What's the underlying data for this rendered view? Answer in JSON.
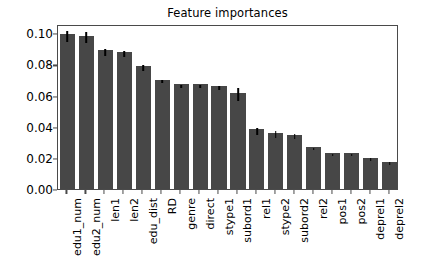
{
  "chart_data": {
    "type": "bar",
    "title": "Feature importances",
    "xlabel": "",
    "ylabel": "",
    "ylim": [
      0.0,
      0.106
    ],
    "yticks": [
      "0.00",
      "0.02",
      "0.04",
      "0.06",
      "0.08",
      "0.10"
    ],
    "ytick_values": [
      0.0,
      0.02,
      0.04,
      0.06,
      0.08,
      0.1
    ],
    "grid": false,
    "legend": null,
    "bar_color": "#474747",
    "errorbar_color": "#000000",
    "categories": [
      "edu1_num",
      "edu2_num",
      "len1",
      "len2",
      "edu_dist",
      "RD",
      "genre",
      "direct",
      "stype1",
      "subord1",
      "rel1",
      "stype2",
      "subord2",
      "rel2",
      "pos1",
      "pos2",
      "deprel1",
      "deprel2"
    ],
    "values": [
      0.0995,
      0.0985,
      0.089,
      0.088,
      0.0793,
      0.0703,
      0.0672,
      0.0673,
      0.0659,
      0.0619,
      0.0383,
      0.0362,
      0.035,
      0.027,
      0.0233,
      0.0233,
      0.0202,
      0.0176
    ],
    "errors": [
      0.0035,
      0.0037,
      0.002,
      0.002,
      0.0019,
      0.0012,
      0.001,
      0.0011,
      0.0013,
      0.0043,
      0.0022,
      0.0023,
      0.0017,
      0.0009,
      0.0007,
      0.0006,
      0.0008,
      0.0011
    ]
  }
}
